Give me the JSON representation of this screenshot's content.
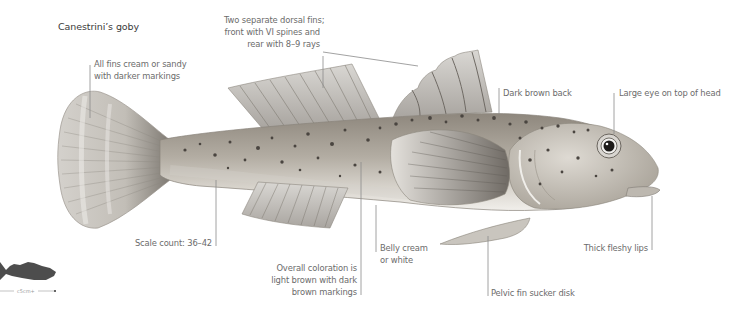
{
  "title": "Canestrini’s goby",
  "annotations": {
    "fins": {
      "line1": "All fins cream or sandy",
      "line2": "with darker markings"
    },
    "dorsal": {
      "line1": "Two separate dorsal fins;",
      "line2": "front with VI spines and",
      "line3": "rear with 8–9 rays"
    },
    "back": "Dark brown back",
    "eye": "Large eye on top of head",
    "scales": "Scale count: 36–42",
    "belly": {
      "line1": "Belly cream",
      "line2": "or white"
    },
    "coloration": {
      "line1": "Overall coloration is",
      "line2": "light brown with dark",
      "line3": "brown markings"
    },
    "pelvic": "Pelvic fin sucker disk",
    "lips": "Thick fleshy lips"
  },
  "scale_indicator": {
    "text": "c5cm+"
  },
  "colors": {
    "body": "#b9b2a6",
    "spots": "#4a4540",
    "fins": "#c9c6c0",
    "leader_line": "#8a8a8a",
    "silhouette": "#4d4d4d"
  }
}
